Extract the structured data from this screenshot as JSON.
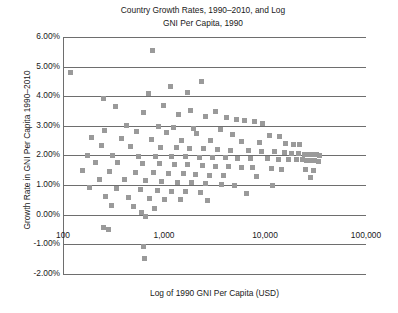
{
  "chart_data": {
    "type": "scatter",
    "title": "Country Growth Rates, 1990–2010, and Log\nGNI Per Capita, 1990",
    "xlabel": "Log of 1990 GNI Per Capita (USD)",
    "ylabel": "Growth Rate in GNI Per Capita 1990–2010",
    "xscale": "log",
    "xlim": [
      100,
      100000
    ],
    "ylim": [
      -0.02,
      0.06
    ],
    "xticks": [
      100,
      1000,
      10000,
      100000
    ],
    "xticklabels": [
      "100",
      "1,000",
      "10,000",
      "100,000"
    ],
    "yticks": [
      -0.02,
      -0.01,
      0,
      0.01,
      0.02,
      0.03,
      0.04,
      0.05,
      0.06
    ],
    "yticklabels": [
      "-2.00%",
      "-1.00%",
      "0.00%",
      "1.00%",
      "2.00%",
      "3.00%",
      "4.00%",
      "5.00%",
      "6.00%"
    ],
    "grid": true,
    "legend": false,
    "marker": "square",
    "marker_color": "#9a9a9a",
    "series": [
      {
        "name": "Countries",
        "points": [
          [
            770,
            0.0556
          ],
          [
            118,
            0.0481
          ],
          [
            1150,
            0.0432
          ],
          [
            2350,
            0.0449
          ],
          [
            700,
            0.0408
          ],
          [
            1700,
            0.0412
          ],
          [
            250,
            0.0391
          ],
          [
            330,
            0.0365
          ],
          [
            980,
            0.0368
          ],
          [
            1850,
            0.0352
          ],
          [
            3200,
            0.0348
          ],
          [
            620,
            0.0344
          ],
          [
            1400,
            0.0339
          ],
          [
            2600,
            0.0331
          ],
          [
            4200,
            0.0327
          ],
          [
            5200,
            0.0322
          ],
          [
            6200,
            0.0318
          ],
          [
            7800,
            0.0314
          ],
          [
            9500,
            0.0309
          ],
          [
            430,
            0.0302
          ],
          [
            880,
            0.0298
          ],
          [
            1250,
            0.0296
          ],
          [
            1950,
            0.0291
          ],
          [
            3600,
            0.0288
          ],
          [
            260,
            0.0285
          ],
          [
            540,
            0.0281
          ],
          [
            1050,
            0.0277
          ],
          [
            2100,
            0.0274
          ],
          [
            4800,
            0.0271
          ],
          [
            11000,
            0.0268
          ],
          [
            14000,
            0.0264
          ],
          [
            190,
            0.0261
          ],
          [
            380,
            0.0258
          ],
          [
            760,
            0.0255
          ],
          [
            1500,
            0.0252
          ],
          [
            2900,
            0.0249
          ],
          [
            5800,
            0.0246
          ],
          [
            8800,
            0.0243
          ],
          [
            16000,
            0.0241
          ],
          [
            19000,
            0.0238
          ],
          [
            22000,
            0.0236
          ],
          [
            240,
            0.0233
          ],
          [
            470,
            0.0231
          ],
          [
            920,
            0.0228
          ],
          [
            1320,
            0.0226
          ],
          [
            1780,
            0.0224
          ],
          [
            2450,
            0.0222
          ],
          [
            3400,
            0.022
          ],
          [
            4600,
            0.0218
          ],
          [
            6800,
            0.0216
          ],
          [
            9200,
            0.0214
          ],
          [
            12500,
            0.0212
          ],
          [
            15500,
            0.021
          ],
          [
            18500,
            0.0208
          ],
          [
            21500,
            0.0206
          ],
          [
            24500,
            0.0205
          ],
          [
            27000,
            0.0204
          ],
          [
            29500,
            0.0203
          ],
          [
            32000,
            0.0202
          ],
          [
            34500,
            0.0201
          ],
          [
            175,
            0.02
          ],
          [
            310,
            0.0199
          ],
          [
            560,
            0.0198
          ],
          [
            830,
            0.0197
          ],
          [
            1180,
            0.0196
          ],
          [
            1620,
            0.0195
          ],
          [
            2250,
            0.0194
          ],
          [
            3050,
            0.0193
          ],
          [
            4100,
            0.0192
          ],
          [
            5400,
            0.0191
          ],
          [
            7200,
            0.019
          ],
          [
            10500,
            0.0189
          ],
          [
            13500,
            0.0188
          ],
          [
            17000,
            0.0187
          ],
          [
            20500,
            0.0186
          ],
          [
            23500,
            0.0185
          ],
          [
            26000,
            0.0184
          ],
          [
            28500,
            0.0183
          ],
          [
            31000,
            0.0182
          ],
          [
            33500,
            0.0181
          ],
          [
            210,
            0.0178
          ],
          [
            350,
            0.0176
          ],
          [
            610,
            0.0174
          ],
          [
            900,
            0.0172
          ],
          [
            1280,
            0.017
          ],
          [
            1720,
            0.0168
          ],
          [
            2380,
            0.0166
          ],
          [
            3250,
            0.0164
          ],
          [
            4400,
            0.0162
          ],
          [
            5900,
            0.016
          ],
          [
            7600,
            0.0158
          ],
          [
            11500,
            0.0156
          ],
          [
            14500,
            0.0154
          ],
          [
            25000,
            0.0152
          ],
          [
            30000,
            0.015
          ],
          [
            155,
            0.0148
          ],
          [
            290,
            0.0146
          ],
          [
            520,
            0.0144
          ],
          [
            790,
            0.0142
          ],
          [
            1100,
            0.014
          ],
          [
            1550,
            0.0138
          ],
          [
            2050,
            0.0136
          ],
          [
            2800,
            0.0134
          ],
          [
            3900,
            0.0132
          ],
          [
            8200,
            0.0128
          ],
          [
            28000,
            0.0126
          ],
          [
            230,
            0.012
          ],
          [
            410,
            0.0118
          ],
          [
            650,
            0.0116
          ],
          [
            950,
            0.0113
          ],
          [
            1350,
            0.011
          ],
          [
            1880,
            0.0108
          ],
          [
            2550,
            0.0105
          ],
          [
            3700,
            0.0102
          ],
          [
            5000,
            0.01
          ],
          [
            12000,
            0.0098
          ],
          [
            185,
            0.0092
          ],
          [
            340,
            0.0089
          ],
          [
            580,
            0.0086
          ],
          [
            860,
            0.0083
          ],
          [
            1200,
            0.008
          ],
          [
            1650,
            0.0077
          ],
          [
            2300,
            0.0074
          ],
          [
            6500,
            0.0071
          ],
          [
            265,
            0.0062
          ],
          [
            450,
            0.0059
          ],
          [
            720,
            0.0056
          ],
          [
            1020,
            0.0053
          ],
          [
            1450,
            0.005
          ],
          [
            2700,
            0.0047
          ],
          [
            300,
            0.0032
          ],
          [
            500,
            0.0028
          ],
          [
            810,
            0.0022
          ],
          [
            600,
            0.0008
          ],
          [
            660,
            -0.0005
          ],
          [
            250,
            -0.0042
          ],
          [
            280,
            -0.005
          ],
          [
            620,
            -0.0108
          ],
          [
            640,
            -0.0148
          ]
        ]
      }
    ]
  }
}
